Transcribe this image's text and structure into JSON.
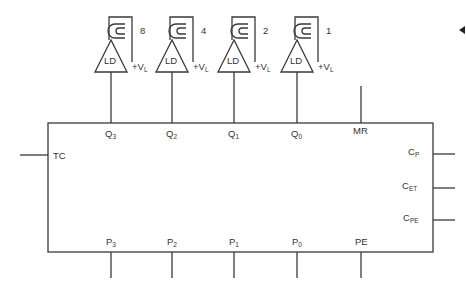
{
  "diagram": {
    "type": "counter-with-led-display",
    "chip": {
      "top_pins": [
        {
          "base": "Q",
          "sub": "3"
        },
        {
          "base": "Q",
          "sub": "2"
        },
        {
          "base": "Q",
          "sub": "1"
        },
        {
          "base": "Q",
          "sub": "0"
        },
        {
          "base": "MR",
          "sub": ""
        }
      ],
      "bottom_pins": [
        {
          "base": "P",
          "sub": "3"
        },
        {
          "base": "P",
          "sub": "2"
        },
        {
          "base": "P",
          "sub": "1"
        },
        {
          "base": "P",
          "sub": "0"
        },
        {
          "base": "PE",
          "sub": ""
        }
      ],
      "left_pins": [
        {
          "base": "TC",
          "sub": ""
        }
      ],
      "right_pins": [
        {
          "base": "C",
          "sub": "P"
        },
        {
          "base": "C",
          "sub": "ET"
        },
        {
          "base": "C",
          "sub": "PE"
        }
      ]
    },
    "drivers": [
      {
        "label": "LD",
        "weight": "8",
        "supply": "+V",
        "supply_sub": "L"
      },
      {
        "label": "LD",
        "weight": "4",
        "supply": "+V",
        "supply_sub": "L"
      },
      {
        "label": "LD",
        "weight": "2",
        "supply": "+V",
        "supply_sub": "L"
      },
      {
        "label": "LD",
        "weight": "1",
        "supply": "+V",
        "supply_sub": "L"
      }
    ],
    "colors": {
      "line": "#3a3a3a",
      "text": "#333333",
      "background": "#ffffff"
    }
  }
}
